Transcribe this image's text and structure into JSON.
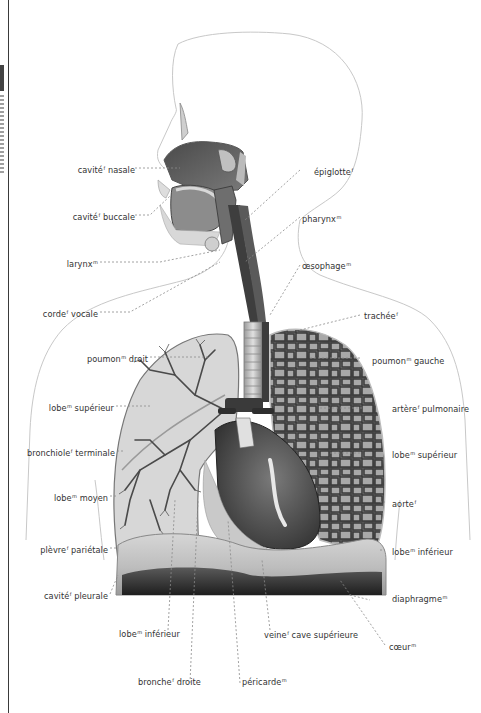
{
  "diagram": {
    "style": "grayscale anatomical illustration",
    "colors": {
      "text": "#333333",
      "leader_line": "#777777",
      "outline": "#c8c8c8",
      "tissue_dark": "#3a3a3a",
      "tissue_mid": "#8a8a8a",
      "tissue_light": "#d8d8d8"
    }
  },
  "labels_left": [
    {
      "text": "cavité",
      "gender": "f",
      "rest": " nasale"
    },
    {
      "text": "cavité",
      "gender": "f",
      "rest": " buccale"
    },
    {
      "text": "larynx",
      "gender": "m",
      "rest": ""
    },
    {
      "text": "corde",
      "gender": "f",
      "rest": " vocale"
    },
    {
      "text": "poumon",
      "gender": "m",
      "rest": " droit"
    },
    {
      "text": "lobe",
      "gender": "m",
      "rest": " supérieur"
    },
    {
      "text": "bronchiole",
      "gender": "f",
      "rest": " terminale"
    },
    {
      "text": "lobe",
      "gender": "m",
      "rest": " moyen"
    },
    {
      "text": "plèvre",
      "gender": "f",
      "rest": " pariétale"
    },
    {
      "text": "cavité",
      "gender": "f",
      "rest": " pleurale"
    }
  ],
  "labels_right": [
    {
      "text": "épiglotte",
      "gender": "f",
      "rest": ""
    },
    {
      "text": "pharynx",
      "gender": "m",
      "rest": ""
    },
    {
      "text": "œsophage",
      "gender": "m",
      "rest": ""
    },
    {
      "text": "trachée",
      "gender": "f",
      "rest": ""
    },
    {
      "text": "poumon",
      "gender": "m",
      "rest": " gauche"
    },
    {
      "text": "artère",
      "gender": "f",
      "rest": " pulmonaire"
    },
    {
      "text": "lobe",
      "gender": "m",
      "rest": " supérieur"
    },
    {
      "text": "aorte",
      "gender": "f",
      "rest": ""
    },
    {
      "text": "lobe",
      "gender": "m",
      "rest": " inférieur"
    },
    {
      "text": "diaphragme",
      "gender": "m",
      "rest": ""
    },
    {
      "text": "cœur",
      "gender": "m",
      "rest": ""
    }
  ],
  "labels_bottom": [
    {
      "text": "lobe",
      "gender": "m",
      "rest": " inférieur"
    },
    {
      "text": "veine",
      "gender": "f",
      "rest": " cave supérieure"
    },
    {
      "text": "bronche",
      "gender": "f",
      "rest": " droite"
    },
    {
      "text": "péricarde",
      "gender": "m",
      "rest": ""
    }
  ]
}
